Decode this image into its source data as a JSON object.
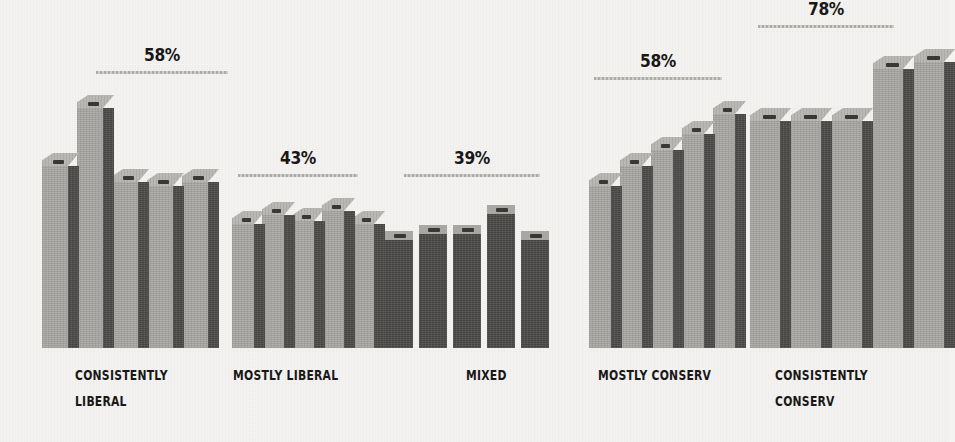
{
  "chart_data": {
    "type": "bar",
    "title": "",
    "subtitle": "",
    "xlabel": "",
    "ylabel": "",
    "grid": false,
    "legend": "none",
    "axis_visible": false,
    "style": "3d-isometric-bars",
    "ylim": [
      0,
      100
    ],
    "categories": [
      "CONSISTENTLY LIBERAL",
      "MOSTLY LIBERAL",
      "MIXED",
      "MOSTLY CONSERV",
      "CONSISTENTLY CONSERV"
    ],
    "annotations": [
      {
        "category": "CONSISTENTLY LIBERAL",
        "label": "58%",
        "value": 58
      },
      {
        "category": "MOSTLY LIBERAL",
        "label": "43%",
        "value": 43
      },
      {
        "category": "MIXED",
        "label": "39%",
        "value": 39
      },
      {
        "category": "MOSTLY CONSERV",
        "label": "58%",
        "value": 58
      },
      {
        "category": "CONSISTENTLY CONSERV",
        "label": "78%",
        "value": 78
      }
    ],
    "groups": [
      {
        "name": "CONSISTENTLY LIBERAL",
        "label_lines": [
          "CONSISTENTLY",
          "LIBERAL"
        ],
        "callout": "58%",
        "callout_value": 58,
        "shading": "side-lit",
        "values": [
          58,
          76,
          53,
          52,
          53
        ]
      },
      {
        "name": "MOSTLY LIBERAL",
        "label_lines": [
          "MOSTLY LIBERAL"
        ],
        "callout": "43%",
        "callout_value": 43,
        "shading": "side-lit",
        "values": [
          40,
          43,
          41,
          44,
          40
        ]
      },
      {
        "name": "MIXED",
        "label_lines": [
          "MIXED"
        ],
        "callout": "39%",
        "callout_value": 39,
        "shading": "head-on",
        "values": [
          36,
          38,
          38,
          44,
          36
        ]
      },
      {
        "name": "MOSTLY CONSERV",
        "label_lines": [
          "MOSTLY CONSERV"
        ],
        "callout": "58%",
        "callout_value": 58,
        "shading": "side-lit",
        "values": [
          52,
          58,
          63,
          68,
          74
        ]
      },
      {
        "name": "CONSISTENTLY CONSERV",
        "label_lines": [
          "CONSISTENTLY",
          "CONSERV"
        ],
        "callout": "78%",
        "callout_value": 78,
        "shading": "side-lit",
        "values": [
          72,
          72,
          72,
          88,
          90
        ]
      }
    ]
  },
  "colors": {
    "background": "#f4f3f1",
    "bar_front_light": "#a9a7a3",
    "bar_side_dark": "#4e4c4b",
    "bar_top": "#b6b4b0",
    "slot": "#3a3837",
    "text": "#191817",
    "rule": "#b9b7b3"
  }
}
